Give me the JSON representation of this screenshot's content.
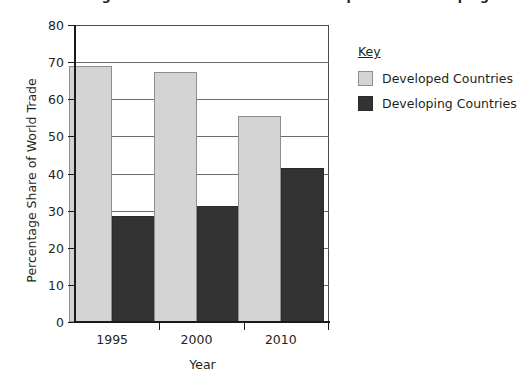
{
  "chart_data": {
    "type": "bar",
    "title": "Percentage Share of World Trade of Developed and Developing Countries",
    "xlabel": "Year",
    "ylabel": "Percentage Share of World Trade",
    "categories": [
      "1995",
      "2000",
      "2010"
    ],
    "series": [
      {
        "name": "Developed Countries",
        "color": "#d4d4d4",
        "values": [
          69,
          67.3,
          55.5
        ]
      },
      {
        "name": "Developing Countries",
        "color": "#333333",
        "values": [
          28.6,
          31.3,
          41.5
        ]
      }
    ],
    "ylim": [
      0,
      80
    ],
    "ytick_step": 10,
    "yticks": [
      "80",
      "70",
      "60",
      "50",
      "40",
      "30",
      "20",
      "10",
      "0"
    ],
    "grid": true,
    "legend_position": "right"
  },
  "legend": {
    "title": "Key",
    "entries": [
      {
        "label": "Developed Countries",
        "swatch": "light"
      },
      {
        "label": "Developing Countries",
        "swatch": "dark"
      }
    ]
  }
}
